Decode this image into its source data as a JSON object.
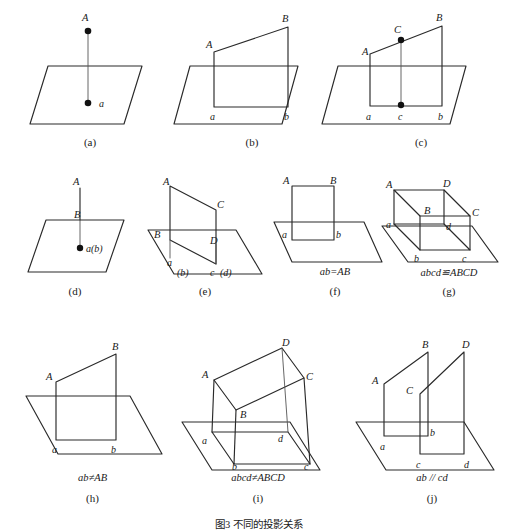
{
  "figure": {
    "title": "图3 不同的投影关系",
    "title_top": 516,
    "width": 518,
    "height": 526
  },
  "panels": [
    {
      "id": "a",
      "caption": "(a)",
      "relation": "",
      "x": 10,
      "y": 4,
      "w": 160,
      "h": 128,
      "caption_x": 10,
      "caption_w": 160,
      "caption_y": 136,
      "labels": [
        {
          "name": "point-A",
          "text": "A",
          "x": 72,
          "y": 13,
          "style": "upper"
        },
        {
          "name": "point-a",
          "text": "a",
          "x": 90,
          "y": 103,
          "style": "lower"
        }
      ]
    },
    {
      "id": "b",
      "caption": "(b)",
      "relation": "",
      "x": 172,
      "y": 4,
      "w": 160,
      "h": 128,
      "caption_x": 172,
      "caption_w": 160,
      "caption_y": 136,
      "labels": [
        {
          "name": "point-A",
          "text": "A",
          "x": 36,
          "y": 40,
          "style": "upper"
        },
        {
          "name": "point-B",
          "text": "B",
          "x": 108,
          "y": 16,
          "style": "upper"
        },
        {
          "name": "point-a",
          "text": "a",
          "x": 35,
          "y": 115,
          "style": "lower"
        },
        {
          "name": "point-b",
          "text": "b",
          "x": 85,
          "y": 115,
          "style": "lower"
        }
      ]
    },
    {
      "id": "c",
      "caption": "(c)",
      "relation": "",
      "x": 336,
      "y": 4,
      "w": 170,
      "h": 128,
      "caption_x": 336,
      "caption_w": 170,
      "caption_y": 136,
      "labels": [
        {
          "name": "point-A",
          "text": "A",
          "x": 36,
          "y": 47,
          "style": "upper"
        },
        {
          "name": "point-B",
          "text": "B",
          "x": 114,
          "y": 16,
          "style": "upper"
        },
        {
          "name": "point-C",
          "text": "C",
          "x": 72,
          "y": 29,
          "style": "upper"
        },
        {
          "name": "point-a",
          "text": "a",
          "x": 37,
          "y": 117,
          "style": "lower"
        },
        {
          "name": "point-b",
          "text": "b",
          "x": 104,
          "y": 117,
          "style": "lower"
        },
        {
          "name": "point-c",
          "text": "c",
          "x": 72,
          "y": 117,
          "style": "lower"
        }
      ]
    },
    {
      "id": "d",
      "caption": "(d)",
      "relation": "",
      "x": 14,
      "y": 172,
      "w": 120,
      "h": 110,
      "caption_x": 10,
      "caption_w": 120,
      "caption_y": 285,
      "labels": [
        {
          "name": "point-A",
          "text": "A",
          "x": 58,
          "y": 12,
          "style": "upper"
        },
        {
          "name": "point-B",
          "text": "B",
          "x": 58,
          "y": 58,
          "style": "upper"
        },
        {
          "name": "point-ab",
          "text": "a(b)",
          "x": 66,
          "y": 91,
          "style": "lower"
        }
      ]
    },
    {
      "id": "e",
      "caption": "(e)",
      "relation": "",
      "x": 148,
      "y": 172,
      "w": 130,
      "h": 110,
      "caption_x": 140,
      "caption_w": 130,
      "caption_y": 285,
      "labels": [
        {
          "name": "point-A",
          "text": "A",
          "x": 18,
          "y": 10,
          "style": "upper"
        },
        {
          "name": "point-B",
          "text": "B",
          "x": 6,
          "y": 60,
          "style": "upper"
        },
        {
          "name": "point-C",
          "text": "C",
          "x": 70,
          "y": 29,
          "style": "upper"
        },
        {
          "name": "point-D",
          "text": "D",
          "x": 66,
          "y": 62,
          "style": "upper"
        },
        {
          "name": "point-a",
          "text": "a",
          "x": 23,
          "y": 90,
          "style": "lower"
        },
        {
          "name": "point-b",
          "text": "(b)",
          "x": 33,
          "y": 100,
          "style": "lower"
        },
        {
          "name": "point-c",
          "text": "c",
          "x": 61,
          "y": 100,
          "style": "lower"
        },
        {
          "name": "point-d",
          "text": "(d)",
          "x": 71,
          "y": 100,
          "style": "lower"
        }
      ]
    },
    {
      "id": "f",
      "caption": "(f)",
      "relation": "ab=AB",
      "x": 278,
      "y": 172,
      "w": 110,
      "h": 100,
      "caption_x": 272,
      "caption_w": 120,
      "caption_y": 285,
      "relation_x": 272,
      "relation_w": 120,
      "relation_y": 269,
      "labels": [
        {
          "name": "point-A",
          "text": "A",
          "x": 10,
          "y": 7,
          "style": "upper"
        },
        {
          "name": "point-B",
          "text": "B",
          "x": 54,
          "y": 7,
          "style": "upper"
        },
        {
          "name": "point-a",
          "text": "a",
          "x": 8,
          "y": 64,
          "style": "lower"
        },
        {
          "name": "point-b",
          "text": "b",
          "x": 55,
          "y": 64,
          "style": "lower"
        }
      ]
    },
    {
      "id": "g",
      "caption": "(g)",
      "relation": "abcd≌ABCD",
      "x": 388,
      "y": 172,
      "w": 124,
      "h": 100,
      "caption_x": 384,
      "caption_w": 130,
      "caption_y": 285,
      "relation_x": 380,
      "relation_w": 138,
      "relation_y": 269,
      "labels": [
        {
          "name": "point-A",
          "text": "A",
          "x": 2,
          "y": 12,
          "style": "upper"
        },
        {
          "name": "point-B",
          "text": "B",
          "x": 32,
          "y": 43,
          "style": "upper"
        },
        {
          "name": "point-C",
          "text": "C",
          "x": 76,
          "y": 43,
          "style": "upper"
        },
        {
          "name": "point-D",
          "text": "D",
          "x": 54,
          "y": 12,
          "style": "upper"
        },
        {
          "name": "point-a",
          "text": "a",
          "x": 0,
          "y": 58,
          "style": "lower"
        },
        {
          "name": "point-b",
          "text": "b",
          "x": 24,
          "y": 88,
          "style": "lower"
        },
        {
          "name": "point-c",
          "text": "c",
          "x": 72,
          "y": 88,
          "style": "lower"
        },
        {
          "name": "point-d",
          "text": "d",
          "x": 58,
          "y": 58,
          "style": "lower"
        }
      ]
    },
    {
      "id": "h",
      "caption": "(h)",
      "relation": "ab≠AB",
      "x": 12,
      "y": 336,
      "w": 160,
      "h": 130,
      "caption_x": 10,
      "caption_w": 160,
      "caption_y": 492,
      "relation_x": 10,
      "relation_w": 160,
      "relation_y": 476,
      "labels": [
        {
          "name": "point-A",
          "text": "A",
          "x": 34,
          "y": 40,
          "style": "upper"
        },
        {
          "name": "point-B",
          "text": "B",
          "x": 100,
          "y": 8,
          "style": "upper"
        },
        {
          "name": "point-a",
          "text": "a",
          "x": 36,
          "y": 116,
          "style": "lower"
        },
        {
          "name": "point-b",
          "text": "b",
          "x": 84,
          "y": 116,
          "style": "lower"
        }
      ]
    },
    {
      "id": "i",
      "caption": "(i)",
      "relation": "abcd≠ABCD",
      "x": 176,
      "y": 336,
      "w": 166,
      "h": 130,
      "caption_x": 172,
      "caption_w": 170,
      "caption_y": 492,
      "relation_x": 172,
      "relation_w": 170,
      "relation_y": 476,
      "labels": [
        {
          "name": "point-A",
          "text": "A",
          "x": 36,
          "y": 38,
          "style": "upper"
        },
        {
          "name": "point-B",
          "text": "B",
          "x": 80,
          "y": 72,
          "style": "upper"
        },
        {
          "name": "point-C",
          "text": "C",
          "x": 128,
          "y": 38,
          "style": "upper"
        },
        {
          "name": "point-D",
          "text": "D",
          "x": 104,
          "y": 6,
          "style": "upper"
        },
        {
          "name": "point-a",
          "text": "a",
          "x": 34,
          "y": 94,
          "style": "lower"
        },
        {
          "name": "point-b",
          "text": "b",
          "x": 64,
          "y": 128,
          "style": "lower"
        },
        {
          "name": "point-c",
          "text": "c",
          "x": 120,
          "y": 128,
          "style": "lower"
        },
        {
          "name": "point-d",
          "text": "d",
          "x": 95,
          "y": 92,
          "style": "lower"
        }
      ]
    },
    {
      "id": "j",
      "caption": "(j)",
      "relation": "ab // cd",
      "x": 350,
      "y": 336,
      "w": 164,
      "h": 130,
      "caption_x": 348,
      "caption_w": 166,
      "caption_y": 492,
      "relation_x": 348,
      "relation_w": 166,
      "relation_y": 476,
      "labels": [
        {
          "name": "point-A",
          "text": "A",
          "x": 24,
          "y": 46,
          "style": "upper"
        },
        {
          "name": "point-B",
          "text": "B",
          "x": 72,
          "y": 6,
          "style": "upper"
        },
        {
          "name": "point-C",
          "text": "C",
          "x": 58,
          "y": 54,
          "style": "upper"
        },
        {
          "name": "point-D",
          "text": "D",
          "x": 110,
          "y": 6,
          "style": "upper"
        },
        {
          "name": "point-a",
          "text": "a",
          "x": 32,
          "y": 118,
          "style": "lower"
        },
        {
          "name": "point-b",
          "text": "b",
          "x": 79,
          "y": 100,
          "style": "lower"
        },
        {
          "name": "point-c",
          "text": "c",
          "x": 62,
          "y": 130,
          "style": "lower"
        },
        {
          "name": "point-d",
          "text": "d",
          "x": 110,
          "y": 130,
          "style": "lower"
        }
      ]
    }
  ]
}
